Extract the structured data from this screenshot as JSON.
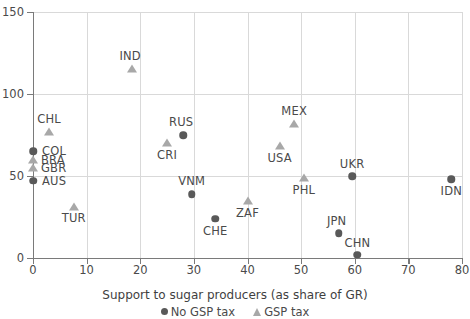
{
  "chart_data": {
    "type": "scatter",
    "title": "",
    "xlabel": "Support to sugar producers (as share of GR)",
    "ylabel": "",
    "xlim": [
      0,
      80
    ],
    "ylim": [
      0,
      150
    ],
    "xticks": [
      0,
      10,
      20,
      30,
      40,
      50,
      60,
      70,
      80
    ],
    "yticks": [
      0,
      50,
      100,
      150
    ],
    "grid": true,
    "legend_position": "bottom",
    "series": [
      {
        "name": "No GSP tax",
        "marker": "circle",
        "color": "#595959",
        "points": [
          {
            "label": "COL",
            "x": 0.0,
            "y": 65
          },
          {
            "label": "AUS",
            "x": 0.0,
            "y": 47
          },
          {
            "label": "RUS",
            "x": 28.0,
            "y": 75
          },
          {
            "label": "VNM",
            "x": 29.6,
            "y": 39
          },
          {
            "label": "CHE",
            "x": 34.0,
            "y": 24
          },
          {
            "label": "UKR",
            "x": 59.5,
            "y": 50
          },
          {
            "label": "JPN",
            "x": 57.0,
            "y": 15
          },
          {
            "label": "CHN",
            "x": 60.5,
            "y": 2
          },
          {
            "label": "IDN",
            "x": 78.0,
            "y": 48
          }
        ]
      },
      {
        "name": "GSP tax",
        "marker": "triangle",
        "color": "#a8a8a8",
        "points": [
          {
            "label": "CHL",
            "x": 3.0,
            "y": 77
          },
          {
            "label": "BRA",
            "x": 0.0,
            "y": 60
          },
          {
            "label": "GBR",
            "x": 0.0,
            "y": 55
          },
          {
            "label": "IND",
            "x": 18.5,
            "y": 115
          },
          {
            "label": "TUR",
            "x": 7.6,
            "y": 31
          },
          {
            "label": "CRI",
            "x": 25.0,
            "y": 70
          },
          {
            "label": "ZAF",
            "x": 40.0,
            "y": 35
          },
          {
            "label": "MEX",
            "x": 48.7,
            "y": 82
          },
          {
            "label": "USA",
            "x": 46.0,
            "y": 68
          },
          {
            "label": "PHL",
            "x": 50.5,
            "y": 49
          }
        ]
      }
    ]
  },
  "axis": {
    "x_title": "Support to sugar producers (as share of GR)",
    "x_tick_labels": [
      "0",
      "10",
      "20",
      "30",
      "40",
      "50",
      "60",
      "70",
      "80"
    ],
    "y_tick_labels": [
      "0",
      "50",
      "100",
      "150"
    ]
  },
  "legend": {
    "items": [
      {
        "label": "No GSP tax",
        "marker": "circle-marker"
      },
      {
        "label": "GSP tax",
        "marker": "triangle-marker"
      }
    ]
  },
  "labels": {
    "CHL": "CHL",
    "COL": "COL",
    "BRA": "BRA",
    "GBR": "GBR",
    "AUS": "AUS",
    "IND": "IND",
    "TUR": "TUR",
    "RUS": "RUS",
    "CRI": "CRI",
    "VNM": "VNM",
    "CHE": "CHE",
    "ZAF": "ZAF",
    "MEX": "MEX",
    "USA": "USA",
    "PHL": "PHL",
    "UKR": "UKR",
    "JPN": "JPN",
    "CHN": "CHN",
    "IDN": "IDN"
  },
  "colors": {
    "circle_marker": "#595959",
    "triangle_marker": "#a8a8a8",
    "gridline": "#d9d9d9",
    "axis": "#7a7a7a",
    "text": "#4a4a4a"
  }
}
